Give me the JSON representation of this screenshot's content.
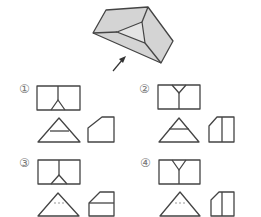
{
  "figure": {
    "solid_fill": "#d9d9d9",
    "line_color": "#444444"
  },
  "options": [
    {
      "number": "1",
      "label": "①"
    },
    {
      "number": "2",
      "label": "②"
    },
    {
      "number": "3",
      "label": "③"
    },
    {
      "number": "4",
      "label": "④"
    }
  ]
}
